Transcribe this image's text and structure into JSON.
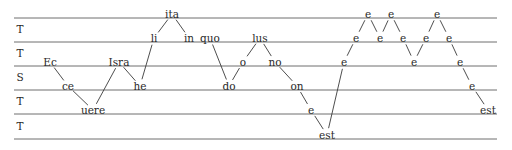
{
  "diagram": {
    "type": "melodic-contour",
    "staff": {
      "x_start": 14,
      "x_end": 497,
      "lines_y": [
        18,
        42,
        66,
        90,
        114,
        139
      ],
      "row_labels": [
        {
          "text": "T",
          "x": 20,
          "y": 33
        },
        {
          "text": "T",
          "x": 20,
          "y": 57
        },
        {
          "text": "S",
          "x": 20,
          "y": 81
        },
        {
          "text": "T",
          "x": 20,
          "y": 105
        },
        {
          "text": "T",
          "x": 20,
          "y": 130
        }
      ]
    },
    "syllables": [
      {
        "text": "Ec",
        "x": 50,
        "y": 66
      },
      {
        "text": "ce",
        "x": 68,
        "y": 90
      },
      {
        "text": "uere",
        "x": 93,
        "y": 114
      },
      {
        "text": "Isra",
        "x": 119,
        "y": 66
      },
      {
        "text": "he",
        "x": 140,
        "y": 90
      },
      {
        "text": "li",
        "x": 154,
        "y": 42
      },
      {
        "text": "ita",
        "x": 172,
        "y": 18
      },
      {
        "text": "in",
        "x": 189,
        "y": 42
      },
      {
        "text": "quo",
        "x": 210,
        "y": 42
      },
      {
        "text": "do",
        "x": 229,
        "y": 90
      },
      {
        "text": "o",
        "x": 243,
        "y": 66
      },
      {
        "text": "lus",
        "x": 260,
        "y": 42
      },
      {
        "text": "no",
        "x": 275,
        "y": 66
      },
      {
        "text": "on",
        "x": 297,
        "y": 90
      },
      {
        "text": "e",
        "x": 311,
        "y": 114
      },
      {
        "text": "est",
        "x": 327,
        "y": 139
      },
      {
        "text": "e",
        "x": 344,
        "y": 66
      },
      {
        "text": "e",
        "x": 356,
        "y": 42
      },
      {
        "text": "e",
        "x": 368,
        "y": 18
      },
      {
        "text": "e",
        "x": 380,
        "y": 42
      },
      {
        "text": "e",
        "x": 391,
        "y": 18
      },
      {
        "text": "e",
        "x": 403,
        "y": 42
      },
      {
        "text": "e",
        "x": 414,
        "y": 66
      },
      {
        "text": "e",
        "x": 426,
        "y": 42
      },
      {
        "text": "e",
        "x": 437,
        "y": 18
      },
      {
        "text": "e",
        "x": 449,
        "y": 42
      },
      {
        "text": "e",
        "x": 460,
        "y": 66
      },
      {
        "text": "e",
        "x": 472,
        "y": 90
      },
      {
        "text": "est",
        "x": 488,
        "y": 114
      }
    ],
    "connections": [
      [
        0,
        1
      ],
      [
        1,
        2
      ],
      [
        2,
        3
      ],
      [
        3,
        4
      ],
      [
        4,
        5
      ],
      [
        5,
        6
      ],
      [
        6,
        7
      ],
      [
        8,
        9
      ],
      [
        9,
        10
      ],
      [
        10,
        11
      ],
      [
        11,
        12
      ],
      [
        12,
        13
      ],
      [
        13,
        14
      ],
      [
        14,
        15
      ],
      [
        15,
        16
      ],
      [
        16,
        17
      ],
      [
        17,
        18
      ],
      [
        18,
        19
      ],
      [
        19,
        20
      ],
      [
        20,
        21
      ],
      [
        21,
        22
      ],
      [
        22,
        23
      ],
      [
        23,
        24
      ],
      [
        24,
        25
      ],
      [
        25,
        26
      ],
      [
        26,
        27
      ],
      [
        27,
        28
      ]
    ],
    "colors": {
      "text": "#2a2a2a",
      "lines": "#6e6e6e",
      "background": "#ffffff"
    }
  }
}
